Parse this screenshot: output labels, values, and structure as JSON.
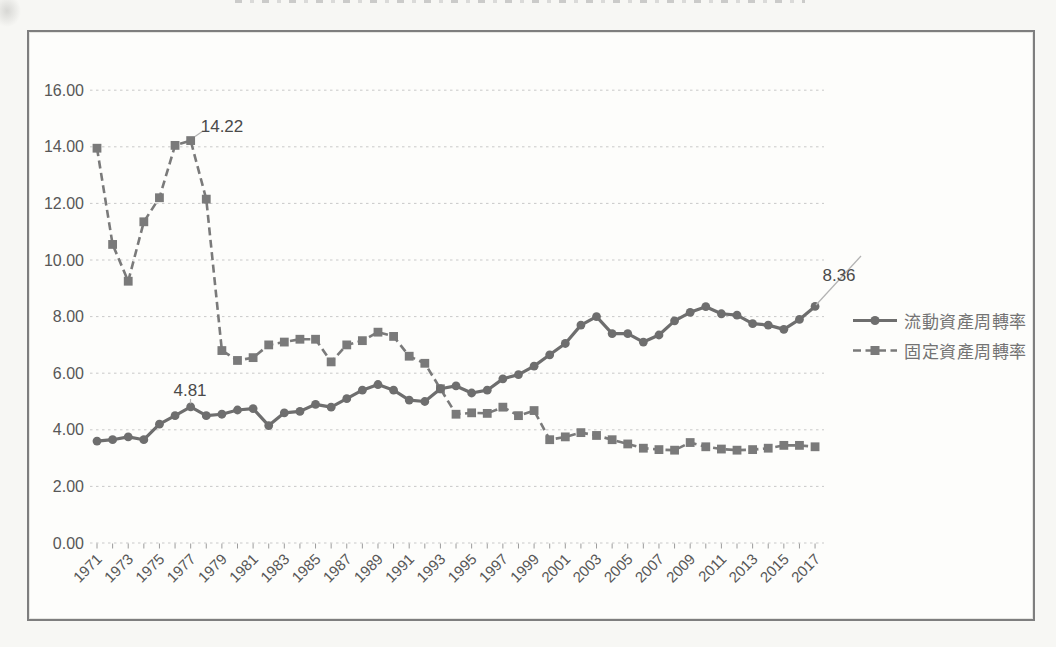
{
  "colors": {
    "current_series": "#6e6e6e",
    "fixed_series": "#7a7a7a",
    "grid": "#c9c9c9",
    "axis_text": "#575757",
    "annotation_text": "#4a4a4a",
    "leader": "#b3b3b3",
    "frame_border": "#7e7e7e",
    "plot_background": "#fdfdfb"
  },
  "legend": {
    "items": [
      {
        "label": "流動資產周轉率",
        "marker": "circle",
        "line": "solid"
      },
      {
        "label": "固定資產周轉率",
        "marker": "square",
        "line": "dashed"
      }
    ]
  },
  "chart_data": {
    "type": "line",
    "title": "",
    "grid": "horizontal-dotted",
    "legend_position": "right-middle",
    "ylim": [
      0,
      16
    ],
    "ytick_step": 2,
    "ytick_labels": [
      "0.00",
      "2.00",
      "4.00",
      "6.00",
      "8.00",
      "10.00",
      "12.00",
      "14.00",
      "16.00"
    ],
    "xtick_years": [
      1971,
      1973,
      1975,
      1977,
      1979,
      1981,
      1983,
      1985,
      1987,
      1989,
      1991,
      1993,
      1995,
      1997,
      1999,
      2001,
      2003,
      2005,
      2007,
      2009,
      2011,
      2013,
      2015,
      2017
    ],
    "x": [
      1971,
      1972,
      1973,
      1974,
      1975,
      1976,
      1977,
      1978,
      1979,
      1980,
      1981,
      1982,
      1983,
      1984,
      1985,
      1986,
      1987,
      1988,
      1989,
      1990,
      1991,
      1992,
      1993,
      1994,
      1995,
      1996,
      1997,
      1998,
      1999,
      2000,
      2001,
      2002,
      2003,
      2004,
      2005,
      2006,
      2007,
      2008,
      2009,
      2010,
      2011,
      2012,
      2013,
      2014,
      2015,
      2016,
      2017
    ],
    "series": [
      {
        "name": "流動資產周轉率",
        "style": "solid",
        "marker": "circle",
        "color": "#6e6e6e",
        "values": [
          3.6,
          3.65,
          3.75,
          3.65,
          4.2,
          4.5,
          4.81,
          4.5,
          4.55,
          4.7,
          4.75,
          4.15,
          4.6,
          4.65,
          4.9,
          4.8,
          5.1,
          5.4,
          5.6,
          5.4,
          5.05,
          5.0,
          5.45,
          5.55,
          5.3,
          5.4,
          5.8,
          5.95,
          6.25,
          6.65,
          7.05,
          7.7,
          8.0,
          7.4,
          7.4,
          7.1,
          7.35,
          7.85,
          8.15,
          8.35,
          8.1,
          8.05,
          7.75,
          7.7,
          7.55,
          7.9,
          8.36
        ]
      },
      {
        "name": "固定資產周轉率",
        "style": "dashed",
        "marker": "square",
        "color": "#7a7a7a",
        "values": [
          13.95,
          10.55,
          9.25,
          11.35,
          12.2,
          14.05,
          14.22,
          12.15,
          6.8,
          6.45,
          6.55,
          7.0,
          7.1,
          7.2,
          7.2,
          6.4,
          7.0,
          7.15,
          7.45,
          7.3,
          6.6,
          6.35,
          5.45,
          4.55,
          4.6,
          4.58,
          4.8,
          4.5,
          4.68,
          3.65,
          3.75,
          3.9,
          3.8,
          3.65,
          3.5,
          3.35,
          3.3,
          3.28,
          3.55,
          3.4,
          3.32,
          3.28,
          3.3,
          3.35,
          3.45,
          3.45,
          3.4
        ]
      }
    ],
    "annotations": [
      {
        "text": "14.22",
        "series": "固定資產周轉率",
        "year": 1977,
        "value": 14.22
      },
      {
        "text": "4.81",
        "series": "流動資產周轉率",
        "year": 1977,
        "value": 4.81
      },
      {
        "text": "8.36",
        "series": "流動資產周轉率",
        "year": 2017,
        "value": 8.36
      }
    ]
  }
}
